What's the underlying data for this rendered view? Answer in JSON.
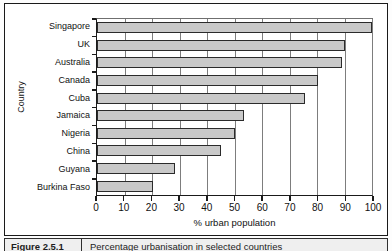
{
  "figure": {
    "caption_number": "Figure 2.5.1",
    "caption_text": "Percentage urbanisation in selected countries"
  },
  "chart_data": {
    "type": "bar",
    "orientation": "horizontal",
    "title": "",
    "xlabel": "% urban population",
    "ylabel": "Country",
    "xlim": [
      0,
      100
    ],
    "xticks": [
      0,
      10,
      20,
      30,
      40,
      50,
      60,
      70,
      80,
      90,
      100
    ],
    "xtick_labels": [
      "0",
      "10",
      "20",
      "30",
      "40",
      "50",
      "60",
      "70",
      "80",
      "90",
      "100"
    ],
    "grid": true,
    "grid_axis": "x",
    "legend": false,
    "bar_fill_color": "#c9c9c9",
    "bar_edge_color": "#2b2b2b",
    "categories": [
      "Singapore",
      "UK",
      "Australia",
      "Canada",
      "Cuba",
      "Jamaica",
      "Nigeria",
      "China",
      "Guyana",
      "Burkina Faso"
    ],
    "values": [
      100,
      90,
      89,
      80.5,
      75.5,
      53.5,
      50,
      45,
      28.5,
      20.5
    ]
  }
}
